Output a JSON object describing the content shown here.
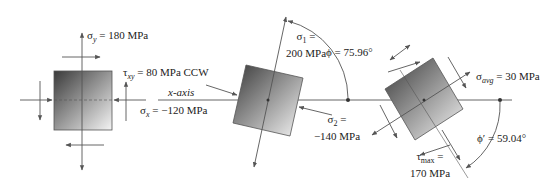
{
  "element1": {
    "sigma_y": "σy = 180 MPa",
    "sigma_y_sym": "σ",
    "sigma_y_sub": "y",
    "sigma_y_val": " = 180 MPa",
    "tau_sym": "τ",
    "tau_sub": "xy",
    "tau_val": " = 80 MPa CCW",
    "x_axis": "x-axis",
    "sigma_x_sym": "σ",
    "sigma_x_sub": "x",
    "sigma_x_val": " = −120 MPa"
  },
  "element2": {
    "sigma1_line1": "σ",
    "sigma1_sub": "1",
    "sigma1_eq": " =",
    "sigma1_line2": "200 MPa",
    "phi": "ϕ = 75.96°",
    "sigma2_line1": "σ",
    "sigma2_sub": "2",
    "sigma2_eq": " =",
    "sigma2_line2": "−140 MPa"
  },
  "element3": {
    "sigma_avg_sym": "σ",
    "sigma_avg_sub": "avg",
    "sigma_avg_val": " = 30 MPa",
    "tau_max_sym": "τ",
    "tau_max_sub": "max",
    "tau_max_eq": " =",
    "tau_max_val": "170 MPa",
    "phi_prime": "ϕ′ = 59.04°"
  },
  "colors": {
    "line": "#555555",
    "square_dark": "#3a3a3a",
    "square_light": "#f4f4f4"
  }
}
